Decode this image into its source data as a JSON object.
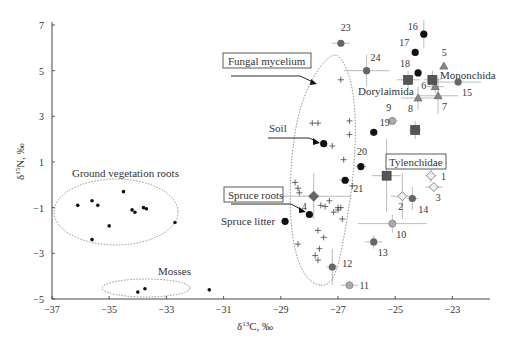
{
  "chart_data": {
    "type": "scatter",
    "title": "",
    "xlabel": "δ13C, ‰",
    "ylabel": "δ15N, ‰",
    "xlim": [
      -37,
      -22.2
    ],
    "ylim": [
      -5,
      7
    ],
    "x_ticks": [
      -37,
      -35,
      -33,
      -31,
      -29,
      -27,
      -25,
      -23
    ],
    "y_ticks": [
      -5,
      -3,
      -1,
      1,
      3,
      5,
      7
    ],
    "grid": false,
    "groups": [
      {
        "name": "Ground vegetation roots",
        "marker": "small-dot",
        "points": [
          [
            -36.1,
            -0.9
          ],
          [
            -35.6,
            -0.7
          ],
          [
            -35.4,
            -0.9
          ],
          [
            -34.5,
            -0.3
          ],
          [
            -35.0,
            -1.8
          ],
          [
            -34.2,
            -1.1
          ],
          [
            -34.1,
            -1.2
          ],
          [
            -33.8,
            -1.0
          ],
          [
            -33.7,
            -1.05
          ],
          [
            -32.7,
            -1.65
          ],
          [
            -35.6,
            -2.4
          ]
        ]
      },
      {
        "name": "Mosses",
        "marker": "small-dot",
        "points": [
          [
            -34.0,
            -4.7
          ],
          [
            -33.75,
            -4.55
          ],
          [
            -31.5,
            -4.6
          ]
        ]
      },
      {
        "name": "Fungal mycelium",
        "marker": "plus",
        "points": [
          [
            -26.9,
            4.6
          ],
          [
            -27.9,
            2.7
          ],
          [
            -27.7,
            2.7
          ],
          [
            -26.6,
            2.8
          ],
          [
            -26.6,
            2.2
          ],
          [
            -27.2,
            1.7
          ],
          [
            -26.8,
            1.1
          ],
          [
            -28.5,
            0.1
          ],
          [
            -28.4,
            -0.15
          ],
          [
            -28.35,
            -0.35
          ],
          [
            -27.3,
            -0.7
          ],
          [
            -27.6,
            -0.9
          ],
          [
            -27.45,
            -0.95
          ],
          [
            -27.15,
            -1.2
          ],
          [
            -26.9,
            -1.0
          ],
          [
            -26.85,
            -1.5
          ],
          [
            -27.0,
            -1.1
          ],
          [
            -27.7,
            -2.0
          ],
          [
            -27.5,
            -2.3
          ],
          [
            -28.4,
            -2.6
          ],
          [
            -27.65,
            -2.8
          ],
          [
            -27.8,
            -3.1
          ],
          [
            -27.7,
            -3.3
          ],
          [
            -26.5,
            -0.05
          ],
          [
            -27.0,
            -1.0
          ]
        ]
      }
    ],
    "labeled_points": [
      {
        "label": "Soil",
        "x": -27.5,
        "y": 1.8,
        "marker": "circle-black",
        "annotation": "Soil"
      },
      {
        "label": "Spruce roots",
        "x": -28.0,
        "y": -1.3,
        "marker": "circle-black",
        "annotation": "Spruce roots"
      },
      {
        "label": "Spruce litter",
        "x": -28.85,
        "y": -1.6,
        "marker": "circle-black",
        "annotation": "Spruce litter"
      },
      {
        "label": "1",
        "x": -23.75,
        "y": 0.4,
        "marker": "diamond-open",
        "err_x": 0.2,
        "err_y": 0.3
      },
      {
        "label": "2",
        "x": -24.75,
        "y": -0.5,
        "marker": "diamond-open",
        "err_x": 0.4,
        "err_y": 1.0
      },
      {
        "label": "3",
        "x": -23.65,
        "y": -0.1,
        "marker": "diamond-open",
        "err_x": 0.3,
        "err_y": 0.2
      },
      {
        "label": "4",
        "x": -27.85,
        "y": -0.5,
        "marker": "diamond-dark",
        "err_x": 1.3,
        "err_y": 1.0
      },
      {
        "label": "5",
        "x": -23.3,
        "y": 5.2,
        "marker": "triangle-gray",
        "err_x": 0,
        "err_y": 0
      },
      {
        "label": "6",
        "x": -23.6,
        "y": 4.3,
        "marker": "triangle-gray",
        "err_x": 0.3,
        "err_y": 0.3
      },
      {
        "label": "7",
        "x": -23.5,
        "y": 3.9,
        "marker": "triangle-gray",
        "err_x": 0.7,
        "err_y": 0.8
      },
      {
        "label": "8",
        "x": -24.2,
        "y": 3.8,
        "marker": "triangle-gray",
        "err_x": 0.6,
        "err_y": 0.5
      },
      {
        "label": "9",
        "x": -25.1,
        "y": 2.8,
        "marker": "circle-lightgray",
        "err_x": 0.2,
        "err_y": 0
      },
      {
        "label": "10",
        "x": -25.1,
        "y": -1.7,
        "marker": "circle-lightgray",
        "err_x": 1.2,
        "err_y": 0.4
      },
      {
        "label": "11",
        "x": -26.6,
        "y": -4.4,
        "marker": "circle-lightgray",
        "err_x": 0.3,
        "err_y": 0
      },
      {
        "label": "12",
        "x": -27.2,
        "y": -3.6,
        "marker": "circle-darkgray",
        "err_x": 0.2,
        "err_y": 0.8
      },
      {
        "label": "13",
        "x": -25.75,
        "y": -2.5,
        "marker": "circle-darkgray",
        "err_x": 0.3,
        "err_y": 0.3
      },
      {
        "label": "14",
        "x": -24.4,
        "y": -0.6,
        "marker": "circle-darkgray",
        "err_x": 0.2,
        "err_y": 0.5
      },
      {
        "label": "15",
        "x": -22.8,
        "y": 4.5,
        "marker": "circle-darkgray",
        "err_x": 0.8,
        "err_y": 0
      },
      {
        "label": "16",
        "x": -24.0,
        "y": 6.6,
        "marker": "circle-black",
        "err_x": 0,
        "err_y": 0.6
      },
      {
        "label": "17",
        "x": -24.3,
        "y": 5.8,
        "marker": "circle-black",
        "err_x": 0,
        "err_y": 0
      },
      {
        "label": "18",
        "x": -24.2,
        "y": 4.9,
        "marker": "circle-black",
        "err_x": 0,
        "err_y": 0
      },
      {
        "label": "19",
        "x": -25.75,
        "y": 2.3,
        "marker": "circle-black",
        "err_x": 0,
        "err_y": 0
      },
      {
        "label": "20",
        "x": -26.2,
        "y": 0.8,
        "marker": "circle-black",
        "err_x": 0.2,
        "err_y": 0
      },
      {
        "label": "21",
        "x": -26.75,
        "y": 0.2,
        "marker": "circle-black",
        "err_x": 0.2,
        "err_y": 0
      },
      {
        "label": "23",
        "x": -26.9,
        "y": 6.2,
        "marker": "circle-darkgray",
        "err_x": 0.3,
        "err_y": 0
      },
      {
        "label": "24",
        "x": -26.0,
        "y": 5.0,
        "marker": "circle-darkgray",
        "err_x": 0.8,
        "err_y": 0.7
      }
    ],
    "group_squares": [
      {
        "name": "Dorylaimida",
        "x": -24.55,
        "y": 4.6,
        "err_x": 0.4,
        "err_y": 0.4
      },
      {
        "name": "Mononchida",
        "x": -23.7,
        "y": 4.6,
        "err_x": 0.3,
        "err_y": 0.4
      },
      {
        "name": "unlabeled",
        "x": -24.3,
        "y": 2.4,
        "err_x": 0.2,
        "err_y": 0.4
      },
      {
        "name": "Tylenchidae",
        "x": -25.3,
        "y": 0.4,
        "err_x": 0.5,
        "err_y": 1.6
      }
    ],
    "annotations": [
      "Ground vegetation roots",
      "Mosses",
      "Fungal mycelium",
      "Soil",
      "Spruce roots",
      "Spruce litter",
      "Dorylaimida",
      "Mononchida",
      "Tylenchidae"
    ]
  },
  "labels": {
    "ground_veg": "Ground vegetation roots",
    "mosses": "Mosses",
    "fungal": "Fungal mycelium",
    "soil": "Soil",
    "spruce_roots": "Spruce roots",
    "spruce_litter": "Spruce litter",
    "dorylaimida": "Dorylaimida",
    "mononchida": "Mononchida",
    "tylenchidae": "Tylenchidae",
    "xlabel_main": "δ",
    "xlabel_sup": "13",
    "xlabel_rest": "C, ‰",
    "ylabel_main": "δ",
    "ylabel_sup": "15",
    "ylabel_rest": "N, ‰"
  }
}
